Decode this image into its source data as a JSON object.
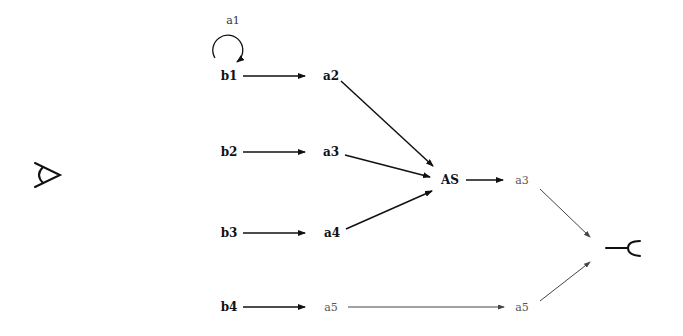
{
  "diagram": {
    "left_symbol": "sideways-A-glyph",
    "right_symbol": "line-with-open-arc-glyph",
    "nodes": {
      "a1": "a1",
      "b1": "b1",
      "b2": "b2",
      "b3": "b3",
      "b4": "b4",
      "a2": "a2",
      "a3": "a3",
      "a4": "a4",
      "a5_left": "a5",
      "AS": "AS",
      "a3_right": "a3",
      "a5_right": "a5"
    },
    "edges": [
      {
        "from": "b1",
        "to": "b1",
        "label": "a1",
        "type": "self-loop"
      },
      {
        "from": "b1",
        "to": "a2"
      },
      {
        "from": "b2",
        "to": "a3"
      },
      {
        "from": "b3",
        "to": "a4"
      },
      {
        "from": "b4",
        "to": "a5_left"
      },
      {
        "from": "a2",
        "to": "AS"
      },
      {
        "from": "a3",
        "to": "AS"
      },
      {
        "from": "a4",
        "to": "AS"
      },
      {
        "from": "AS",
        "to": "a3_right"
      },
      {
        "from": "a5_left",
        "to": "a5_right"
      },
      {
        "from": "a3_right",
        "to": "right_symbol"
      },
      {
        "from": "a5_right",
        "to": "right_symbol"
      }
    ]
  }
}
